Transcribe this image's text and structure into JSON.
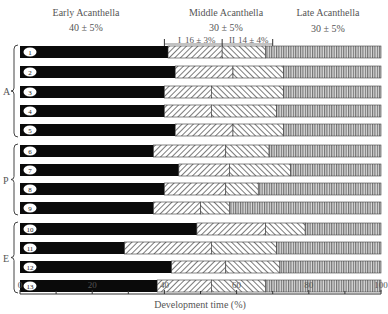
{
  "chart_data": {
    "type": "bar",
    "orientation": "horizontal-stacked",
    "xlabel": "Development time (%)",
    "xlim": [
      0,
      100
    ],
    "xticks": [
      "0",
      "20",
      "40",
      "60",
      "80",
      "100"
    ],
    "xtick_values": [
      0,
      20,
      40,
      60,
      80,
      100
    ],
    "phases": [
      {
        "name": "Early Acanthella",
        "value": "40 ± 5%"
      },
      {
        "name": "Middle Acanthella",
        "value": "30 ± 5%",
        "subphases": [
          {
            "name": "I",
            "value": "16 ± 3%"
          },
          {
            "name": "II",
            "value": "14 ± 4%"
          }
        ]
      },
      {
        "name": "Late Acanthella",
        "value": "30 ± 5%"
      }
    ],
    "phase_markers": [
      40,
      56,
      70
    ],
    "groups": [
      {
        "label": "A",
        "rows": [
          1,
          2,
          3,
          4,
          5
        ]
      },
      {
        "label": "P",
        "rows": [
          6,
          7,
          8,
          9
        ]
      },
      {
        "label": "E",
        "rows": [
          10,
          11,
          12,
          13
        ]
      }
    ],
    "rows": [
      {
        "id": "1",
        "early_end": 41,
        "mid1_end": 56,
        "mid2_end": 68
      },
      {
        "id": "2",
        "early_end": 43,
        "mid1_end": 59,
        "mid2_end": 73
      },
      {
        "id": "3",
        "early_end": 40,
        "mid1_end": 53,
        "mid2_end": 73
      },
      {
        "id": "4",
        "early_end": 40,
        "mid1_end": 53,
        "mid2_end": 71
      },
      {
        "id": "5",
        "early_end": 43,
        "mid1_end": 59,
        "mid2_end": 73
      },
      {
        "id": "6",
        "early_end": 37,
        "mid1_end": 57,
        "mid2_end": 69
      },
      {
        "id": "7",
        "early_end": 44,
        "mid1_end": 58,
        "mid2_end": 75
      },
      {
        "id": "8",
        "early_end": 40,
        "mid1_end": 57,
        "mid2_end": 66
      },
      {
        "id": "9",
        "early_end": 37,
        "mid1_end": 50,
        "mid2_end": 58
      },
      {
        "id": "10",
        "early_end": 49,
        "mid1_end": 68,
        "mid2_end": 79
      },
      {
        "id": "11",
        "early_end": 29,
        "mid1_end": 53,
        "mid2_end": 71
      },
      {
        "id": "12",
        "early_end": 42,
        "mid1_end": 57,
        "mid2_end": 72
      },
      {
        "id": "13",
        "early_end": 38,
        "mid1_end": 53,
        "mid2_end": 68
      }
    ]
  }
}
